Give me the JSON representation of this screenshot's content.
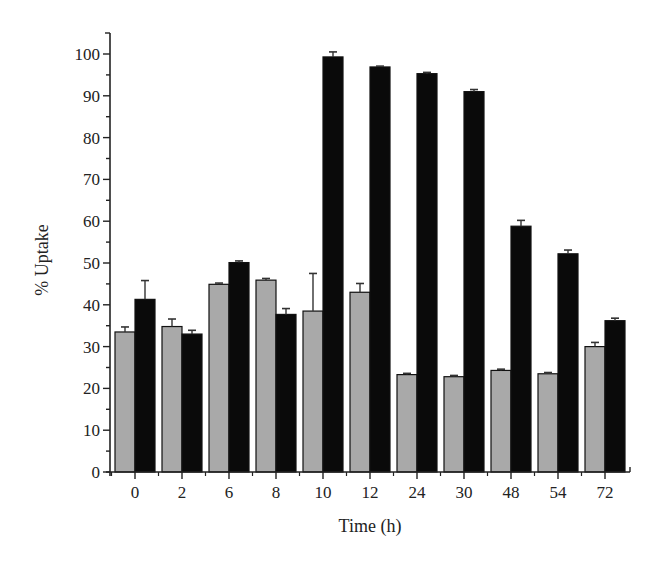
{
  "chart_data": {
    "type": "bar",
    "title": "",
    "xlabel": "Time (h)",
    "ylabel": "% Uptake",
    "ylim": [
      0,
      100
    ],
    "yticks": [
      0,
      10,
      20,
      30,
      40,
      50,
      60,
      70,
      80,
      90,
      100
    ],
    "grid": false,
    "legend": null,
    "categories": [
      "0",
      "2",
      "6",
      "8",
      "10",
      "12",
      "24",
      "30",
      "48",
      "54",
      "72"
    ],
    "series": [
      {
        "name": "gray",
        "color": "#a9a9a9",
        "values": [
          33.5,
          34.8,
          44.9,
          45.9,
          38.5,
          43.0,
          23.3,
          22.8,
          24.3,
          23.5,
          30.0
        ],
        "error": [
          1.2,
          1.8,
          0.3,
          0.4,
          9.0,
          2.1,
          0.3,
          0.3,
          0.3,
          0.3,
          1.0
        ]
      },
      {
        "name": "black",
        "color": "#0a0a0a",
        "values": [
          41.3,
          33.0,
          50.1,
          37.7,
          99.3,
          96.9,
          95.3,
          91.0,
          58.8,
          52.2,
          36.2
        ],
        "error": [
          4.5,
          0.9,
          0.4,
          1.4,
          1.2,
          0.2,
          0.3,
          0.5,
          1.4,
          0.9,
          0.6
        ]
      }
    ]
  }
}
